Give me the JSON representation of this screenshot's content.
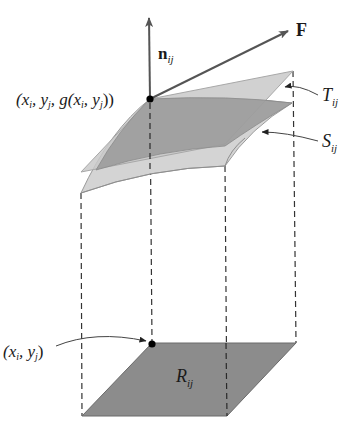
{
  "figure": {
    "type": "surface-integral-flux-diagram",
    "colors": {
      "tangent_plane": "#c8c8c8",
      "surface_top": "#9a9a9a",
      "surface_side": "#d2d2d2",
      "region": "#8c8c8c",
      "vector": "#555555",
      "point": "#000000",
      "dashed_lines": "#333333"
    },
    "labels": {
      "normal_vector": {
        "main": "n",
        "sub": "ij"
      },
      "field_vector": {
        "main": "F"
      },
      "surface_point": {
        "text": "(x",
        "s1": "i",
        "t2": ", y",
        "s2": "j",
        "t3": ", g(x",
        "s3": "i",
        "t4": ", y",
        "s4": "j",
        "t5": "))"
      },
      "tangent_plane": {
        "main": "T",
        "sub": "ij"
      },
      "surface_patch": {
        "main": "S",
        "sub": "ij"
      },
      "domain_point": {
        "text": "(x",
        "s1": "i",
        "t2": ", y",
        "s2": "j",
        "t3": ")"
      },
      "region": {
        "main": "R",
        "sub": "ij"
      }
    }
  }
}
